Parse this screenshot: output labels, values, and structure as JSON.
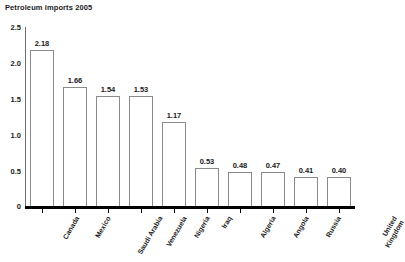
{
  "chart_data": {
    "type": "bar",
    "title": "Petroleum imports 2005",
    "xlabel": "",
    "ylabel": "",
    "ylim": [
      0,
      2.5
    ],
    "yticks": [
      "0",
      "0.5",
      "1.0",
      "1.5",
      "2.0",
      "2.5"
    ],
    "ytick_values": [
      0,
      0.5,
      1.0,
      1.5,
      2.0,
      2.5
    ],
    "grid": false,
    "legend": false,
    "categories": [
      "Canada",
      "Mexico",
      "Saudi Arabia",
      "Venezuela",
      "Nigeria",
      "Iraq",
      "Algeria",
      "Angola",
      "Russia",
      "United Kingdom"
    ],
    "values": [
      2.18,
      1.66,
      1.54,
      1.53,
      1.17,
      0.53,
      0.48,
      0.47,
      0.41,
      0.4
    ],
    "value_labels": [
      "2.18",
      "1.66",
      "1.54",
      "1.53",
      "1.17",
      "0.53",
      "0.48",
      "0.47",
      "0.41",
      "0.40"
    ]
  },
  "style": {
    "bar_fill": "#ffffff",
    "bar_stroke": "#8a8a8a",
    "axis_color": "#000000",
    "y_axis_color": "#6e6e6e",
    "text_color": "#1a1a1a",
    "background": "#ffffff"
  }
}
